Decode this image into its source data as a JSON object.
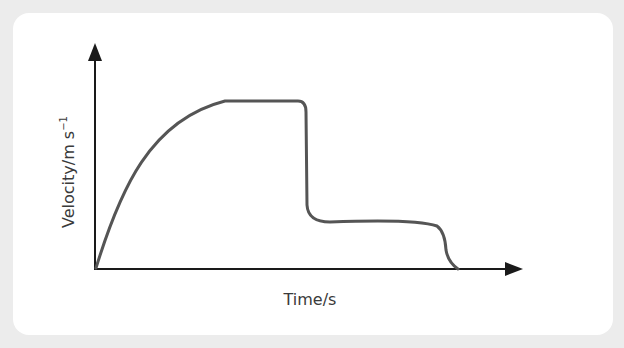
{
  "chart_data": {
    "type": "line",
    "title": "",
    "xlabel": "Time/s",
    "ylabel": "Velocity/m s⁻¹",
    "ylabel_base": "Velocity/m s",
    "ylabel_sup": "−1",
    "grid": false,
    "legend": null,
    "ticks": "none (qualitative sketch)",
    "series": [
      {
        "name": "velocity",
        "description": "Rapid rise with decreasing gradient to a constant terminal velocity, sudden steep drop, second lower constant velocity, then drop to zero",
        "points_normalized": [
          [
            0.0,
            0.0
          ],
          [
            0.07,
            0.45
          ],
          [
            0.15,
            0.77
          ],
          [
            0.29,
            1.0
          ],
          [
            0.48,
            1.0
          ],
          [
            0.5,
            0.98
          ],
          [
            0.51,
            0.3
          ],
          [
            0.55,
            0.22
          ],
          [
            0.8,
            0.22
          ],
          [
            0.85,
            0.12
          ],
          [
            0.87,
            0.0
          ]
        ]
      }
    ],
    "colors": {
      "curve": "#555555",
      "axes": "#1a1a1a",
      "card": "#ffffff",
      "background": "#ececec"
    }
  },
  "axes": {
    "x_label": "Time/s",
    "y_label_base": "Velocity/m s",
    "y_label_sup": "−1"
  }
}
